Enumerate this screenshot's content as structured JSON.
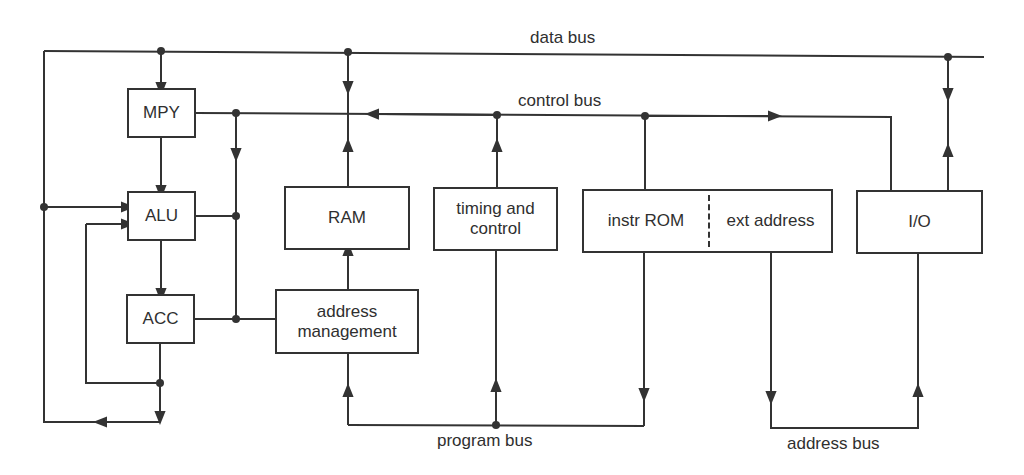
{
  "diagram": {
    "type": "processor block diagram",
    "buses": {
      "data_bus": "data bus",
      "control_bus": "control bus",
      "program_bus": "program bus",
      "address_bus": "address bus"
    },
    "blocks": {
      "mpy": "MPY",
      "alu": "ALU",
      "acc": "ACC",
      "ram": "RAM",
      "timing_line1": "timing and",
      "timing_line2": "control",
      "instr_rom": "instr ROM",
      "ext_address": "ext address",
      "io": "I/O",
      "addr_mgmt_line1": "address",
      "addr_mgmt_line2": "management"
    },
    "colors": {
      "line": "#333333",
      "background": "#ffffff",
      "text": "#2f2f2f"
    }
  }
}
